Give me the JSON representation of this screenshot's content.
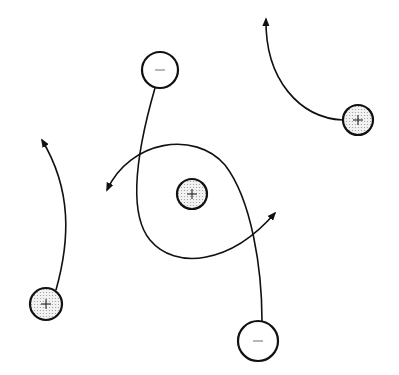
{
  "diagram": {
    "title": "",
    "colors": {
      "stroke": "#111111",
      "positive_fill": "#e6e6e6",
      "negative_fill": "#ffffff"
    },
    "particles": [
      {
        "id": "neg-top",
        "charge": "negative",
        "symbol": "−",
        "cx": 160,
        "cy": 70,
        "r": 18
      },
      {
        "id": "pos-center",
        "charge": "positive",
        "symbol": "+",
        "cx": 192,
        "cy": 194,
        "r": 15
      },
      {
        "id": "pos-right",
        "charge": "positive",
        "symbol": "+",
        "cx": 358,
        "cy": 120,
        "r": 15
      },
      {
        "id": "pos-bottom-left",
        "charge": "positive",
        "symbol": "+",
        "cx": 46,
        "cy": 304,
        "r": 16
      },
      {
        "id": "neg-bottom",
        "charge": "negative",
        "symbol": "−",
        "cx": 258,
        "cy": 341,
        "r": 20
      }
    ],
    "trajectories": [
      {
        "id": "path-neg-top-loop",
        "from": "neg-top",
        "d": "M155,88 C140,140 125,210 150,240 C175,270 230,265 275,213"
      },
      {
        "id": "path-neg-bottom-arc",
        "from": "neg-bottom",
        "d": "M262,321 C262,270 252,200 225,165 C195,130 130,140 107,190"
      },
      {
        "id": "path-pos-bottom-left",
        "from": "pos-bottom-left",
        "d": "M56,290 C70,240 72,190 42,140"
      },
      {
        "id": "path-pos-right",
        "from": "pos-right",
        "d": "M343,120 C300,118 265,80 266,19"
      }
    ]
  }
}
